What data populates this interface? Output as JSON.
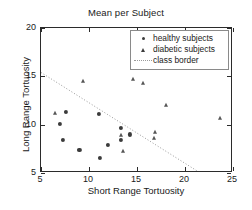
{
  "chart_data": {
    "type": "scatter",
    "title": "Mean per Subject",
    "xlabel": "Short Range Tortuosity",
    "ylabel": "Long Range Tortuosity",
    "xlim": [
      5,
      25
    ],
    "ylim": [
      5,
      20
    ],
    "xticks": [
      5,
      10,
      15,
      20,
      25
    ],
    "yticks": [
      5,
      10,
      15,
      20
    ],
    "grid": false,
    "legend_position": "top-right",
    "series": [
      {
        "name": "healthy subjects",
        "marker": "dot",
        "color": "#3b3b3b",
        "points": [
          {
            "x": 7.0,
            "y": 10.1
          },
          {
            "x": 7.6,
            "y": 11.3
          },
          {
            "x": 7.3,
            "y": 8.4
          },
          {
            "x": 9.0,
            "y": 7.4
          },
          {
            "x": 11.0,
            "y": 11.1
          },
          {
            "x": 11.1,
            "y": 6.6
          },
          {
            "x": 12.0,
            "y": 7.9
          },
          {
            "x": 13.3,
            "y": 9.7
          },
          {
            "x": 13.3,
            "y": 8.4
          },
          {
            "x": 14.3,
            "y": 9.0
          }
        ]
      },
      {
        "name": "diabetic subjects",
        "marker": "triangle",
        "color": "#555555",
        "points": [
          {
            "x": 6.5,
            "y": 11.2
          },
          {
            "x": 9.4,
            "y": 14.5
          },
          {
            "x": 13.3,
            "y": 8.9
          },
          {
            "x": 13.5,
            "y": 7.3
          },
          {
            "x": 14.6,
            "y": 14.7
          },
          {
            "x": 15.6,
            "y": 14.3
          },
          {
            "x": 16.9,
            "y": 9.2
          },
          {
            "x": 16.8,
            "y": 8.6
          },
          {
            "x": 18.0,
            "y": 12.0
          },
          {
            "x": 23.6,
            "y": 10.7
          }
        ]
      }
    ],
    "class_border": {
      "name": "class border",
      "style": "dotted",
      "color": "#9a9a9a",
      "x0": 5.0,
      "y0": 15.4,
      "x1": 21.6,
      "y1": 5.0
    },
    "legend": [
      {
        "label": "healthy subjects",
        "marker": "dot"
      },
      {
        "label": "diabetic subjects",
        "marker": "triangle"
      },
      {
        "label": "class border",
        "marker": "line"
      }
    ]
  }
}
